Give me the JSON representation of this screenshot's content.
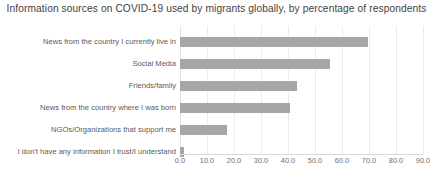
{
  "chart_data": {
    "type": "bar",
    "orientation": "horizontal",
    "title": "Information sources on COVID-19 used by migrants globally, by percentage of respondents",
    "xlabel": "",
    "ylabel": "",
    "xlim": [
      0.0,
      90.0
    ],
    "xticks": [
      "0.0",
      "10.0",
      "20.0",
      "30.0",
      "40.0",
      "50.0",
      "60.0",
      "70.0",
      "80.0",
      "90.0"
    ],
    "xtick_values": [
      0,
      10,
      20,
      30,
      40,
      50,
      60,
      70,
      80,
      90
    ],
    "grid": true,
    "legend": "none",
    "bar_color": "#a6a6a6",
    "categories": [
      "News from the country I currently live in",
      "Social Media",
      "Friends/family",
      "News from the country where I was born",
      "NGOs/Organizations that support me",
      "I don't have any information I trust/I understand"
    ],
    "values": [
      69.6,
      55.6,
      43.3,
      40.7,
      17.4,
      1.5
    ],
    "bars": [
      {
        "label": "News from the country I currently live in",
        "value": 69.6
      },
      {
        "label": "Social Media",
        "value": 55.6
      },
      {
        "label": "Friends/family",
        "value": 43.3
      },
      {
        "label": "News from the country where I was born",
        "value": 40.7
      },
      {
        "label": "NGOs/Organizations that support me",
        "value": 17.4
      },
      {
        "label": "I don't have any information I trust/I understand",
        "value": 1.5
      }
    ]
  }
}
